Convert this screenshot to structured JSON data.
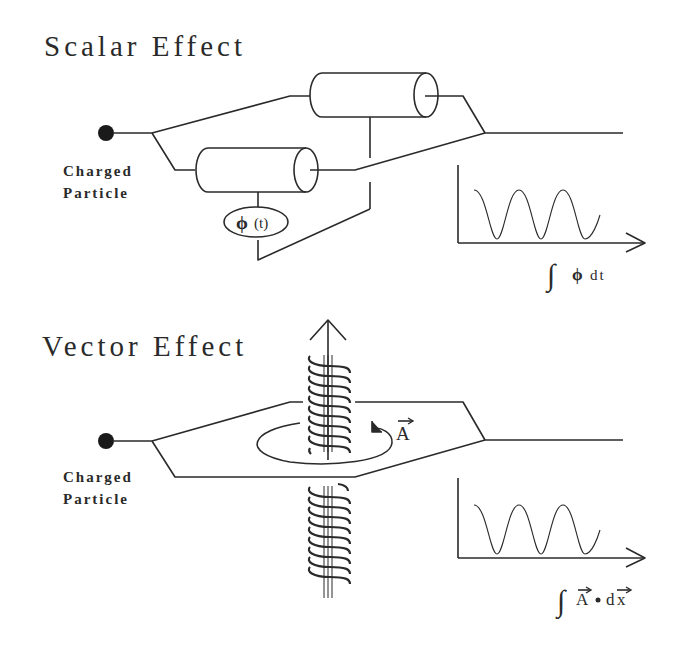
{
  "scalar": {
    "title": "Scalar Effect",
    "particle_label_line1": "Charged",
    "particle_label_line2": "Particle",
    "potential_label": "ϕ(t)",
    "graph_label": "∫ ϕ dt"
  },
  "vector": {
    "title": "Vector Effect",
    "particle_label_line1": "Charged",
    "particle_label_line2": "Particle",
    "potential_label": "A⃗",
    "graph_label": "∫ A⃗ · dx⃗"
  },
  "colors": {
    "ink": "#2a2a2a",
    "background": "#ffffff"
  }
}
